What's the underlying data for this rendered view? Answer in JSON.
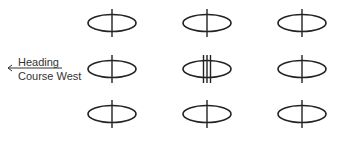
{
  "diagram": {
    "label_heading": "Heading",
    "label_course": "Course West",
    "arrow_direction": "left",
    "grid": [
      {
        "row": 1,
        "col": 1,
        "lines": 1
      },
      {
        "row": 1,
        "col": 2,
        "lines": 1
      },
      {
        "row": 1,
        "col": 3,
        "lines": 1
      },
      {
        "row": 2,
        "col": 1,
        "lines": 1
      },
      {
        "row": 2,
        "col": 2,
        "lines": 3
      },
      {
        "row": 2,
        "col": 3,
        "lines": 1
      },
      {
        "row": 3,
        "col": 1,
        "lines": 1
      },
      {
        "row": 3,
        "col": 2,
        "lines": 1
      },
      {
        "row": 3,
        "col": 3,
        "lines": 1
      }
    ]
  }
}
